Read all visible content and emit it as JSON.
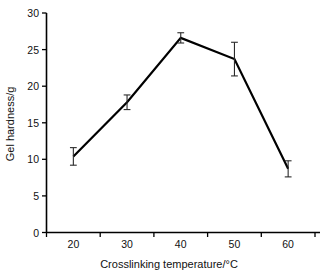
{
  "chart_data": {
    "type": "line",
    "title": "",
    "xlabel": "Crosslinking temperature/°C",
    "ylabel": "Gel hardness/g",
    "x": [
      20,
      30,
      40,
      50,
      60
    ],
    "values": [
      10.4,
      17.8,
      26.6,
      23.7,
      8.7
    ],
    "errors": [
      1.2,
      1.0,
      0.7,
      2.3,
      1.1
    ],
    "xlim": [
      15,
      65
    ],
    "ylim": [
      0,
      30
    ],
    "xticks": [
      20,
      30,
      40,
      50,
      60
    ],
    "yticks": [
      0,
      5,
      10,
      15,
      20,
      25,
      30
    ],
    "xtick_labels": [
      "20",
      "30",
      "40",
      "50",
      "60"
    ],
    "ytick_labels": [
      "0",
      "5",
      "10",
      "15",
      "20",
      "25",
      "30"
    ],
    "grid": false,
    "legend": false,
    "series_color": "#000000",
    "error_color": "#2b2b2b",
    "background": "#ffffff",
    "marker": "none",
    "series": [
      {
        "name": "Gel hardness",
        "values": [
          10.4,
          17.8,
          26.6,
          23.7,
          8.7
        ]
      }
    ]
  },
  "axes": {
    "y_title": "Gel hardness/g",
    "x_title": "Crosslinking temperature/°C"
  },
  "ticks": {
    "y": [
      "30",
      "25",
      "20",
      "15",
      "10",
      "5",
      "0"
    ],
    "x": [
      "20",
      "30",
      "40",
      "50",
      "60"
    ]
  }
}
